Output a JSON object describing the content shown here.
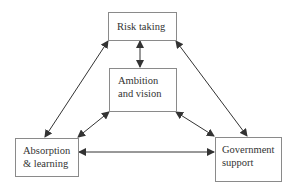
{
  "diagram": {
    "nodes": [
      {
        "id": "risk",
        "label": "Risk taking",
        "lines": [
          "Risk taking"
        ]
      },
      {
        "id": "ambition",
        "label": "Ambition and vision",
        "lines": [
          "Ambition",
          "and vision"
        ]
      },
      {
        "id": "absorption",
        "label": "Absorption & learning",
        "lines": [
          "Absorption",
          "& learning"
        ]
      },
      {
        "id": "government",
        "label": "Government support",
        "lines": [
          "Government",
          "support"
        ]
      }
    ],
    "edges": [
      {
        "from": "risk",
        "to": "ambition",
        "type": "bidirectional"
      },
      {
        "from": "risk",
        "to": "absorption",
        "type": "bidirectional"
      },
      {
        "from": "risk",
        "to": "government",
        "type": "bidirectional"
      },
      {
        "from": "ambition",
        "to": "absorption",
        "type": "bidirectional"
      },
      {
        "from": "ambition",
        "to": "government",
        "type": "bidirectional"
      },
      {
        "from": "absorption",
        "to": "government",
        "type": "bidirectional"
      }
    ],
    "colors": {
      "line": "#333333",
      "border": "#8a8a8a",
      "text": "#333333"
    }
  }
}
